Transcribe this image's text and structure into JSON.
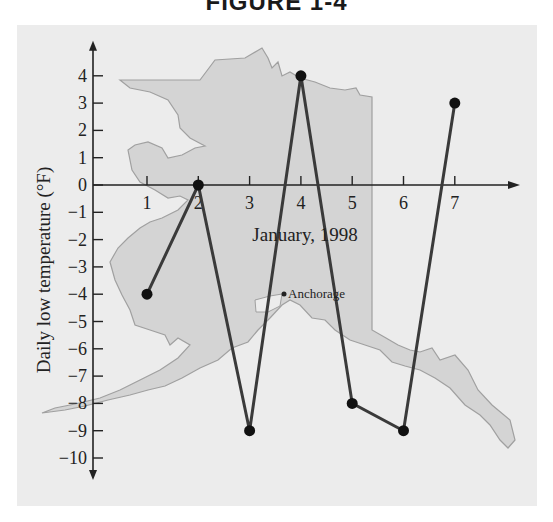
{
  "figure": {
    "title": "FIGURE 1-4"
  },
  "colors": {
    "panel_bg": "#ececec",
    "map_fill": "#d4d4d4",
    "map_outline": "#a0a0a0",
    "line": "#3a3a3a",
    "axis": "#222222"
  },
  "map": {
    "label": "Anchorage"
  },
  "chart_data": {
    "type": "line",
    "title": "FIGURE 1-4",
    "xlabel": "January, 1998",
    "ylabel": "Daily low temperature (°F)",
    "x": [
      1,
      2,
      3,
      4,
      5,
      6,
      7
    ],
    "x_tick_labels": [
      "1",
      "2",
      "3",
      "4",
      "5",
      "6",
      "7"
    ],
    "y_tick_labels": [
      "4",
      "3",
      "2",
      "1",
      "0",
      "-1",
      "-2",
      "-3",
      "-4",
      "-5",
      "-6",
      "-7",
      "-8",
      "-9",
      "-10"
    ],
    "series": [
      {
        "name": "Daily low temperature",
        "values": [
          -4,
          0,
          -9,
          4,
          -8,
          -9,
          3
        ]
      }
    ],
    "xlim": [
      0,
      7.5
    ],
    "ylim": [
      -10,
      4
    ],
    "grid": false,
    "legend": null,
    "annotations": [
      "Anchorage"
    ],
    "background_image": "Map of Alaska"
  }
}
